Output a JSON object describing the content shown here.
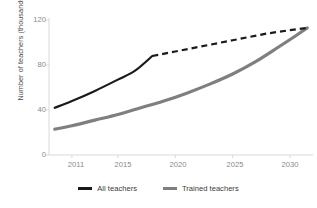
{
  "chart_data": {
    "type": "line",
    "title": "",
    "xlabel": "",
    "ylabel": "Number of teachers (thousands)",
    "xlim": [
      2009,
      2032
    ],
    "ylim": [
      0,
      120
    ],
    "ytick_labels": [
      "120",
      "80",
      "40",
      "0"
    ],
    "yticks": [
      120,
      80,
      40,
      0
    ],
    "xtick_labels": [
      "2011",
      "2015",
      "2020",
      "2025",
      "2030"
    ],
    "xticks": [
      2011,
      2015,
      2020,
      2025,
      2030
    ],
    "grid": false,
    "legend_position": "bottom",
    "colors": {
      "all_teachers": "#1a1a1a",
      "trained_teachers": "#7f7f7f",
      "axis": "#d4d4d4",
      "tick_text": "#8a8a8a",
      "axis_title": "#4a4a4a"
    },
    "series": [
      {
        "name": "All teachers",
        "color": "#1a1a1a",
        "style": "solid-then-dashed",
        "break_at_x": 2018,
        "x": [
          2009.5,
          2011,
          2013,
          2015,
          2016.5,
          2018,
          2020,
          2022,
          2025,
          2028,
          2030,
          2031.5
        ],
        "values": [
          42,
          48,
          57,
          67,
          75,
          88,
          92,
          96,
          102,
          108,
          111,
          113
        ]
      },
      {
        "name": "Trained teachers",
        "color": "#7f7f7f",
        "style": "solid",
        "x": [
          2009.5,
          2011,
          2013,
          2015,
          2017,
          2019,
          2021,
          2023,
          2025,
          2027,
          2029,
          2030.5,
          2031.5
        ],
        "values": [
          23,
          26,
          31,
          36,
          42,
          48,
          55,
          63,
          72,
          83,
          96,
          106,
          113
        ]
      }
    ]
  },
  "legend": {
    "items": [
      {
        "label": "All teachers",
        "color": "#1a1a1a"
      },
      {
        "label": "Trained teachers",
        "color": "#7f7f7f"
      }
    ]
  },
  "axes": {
    "y_title": "Number of teachers (thousands)",
    "y_labels": [
      "120",
      "80",
      "40",
      "0"
    ],
    "x_labels": [
      "2011",
      "2015",
      "2020",
      "2025",
      "2030"
    ]
  }
}
